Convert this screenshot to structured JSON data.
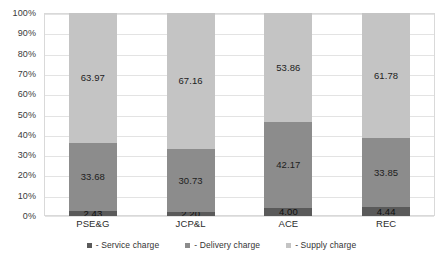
{
  "chart_data": {
    "type": "bar",
    "title": "",
    "subtitle": "",
    "xlabel": "",
    "ylabel": "",
    "stacked": true,
    "stack_mode": "percent",
    "grid": true,
    "legend_position": "bottom",
    "ylim": [
      0,
      100
    ],
    "ytick_labels": [
      "100%",
      "90%",
      "80%",
      "70%",
      "60%",
      "50%",
      "40%",
      "30%",
      "20%",
      "10%",
      "0%"
    ],
    "ytick_values": [
      100,
      90,
      80,
      70,
      60,
      50,
      40,
      30,
      20,
      10,
      0
    ],
    "categories": [
      "PSE&G",
      "JCP&L",
      "ACE",
      "REC"
    ],
    "series": [
      {
        "name": "- Service charge",
        "color": "#5a5a5a",
        "values": [
          2.43,
          2.2,
          4.0,
          4.44
        ],
        "labels": [
          "2.43",
          "2.20",
          "4.00",
          "4.44"
        ]
      },
      {
        "name": "- Delivery charge",
        "color": "#8c8c8c",
        "values": [
          33.68,
          30.73,
          42.17,
          33.85
        ],
        "labels": [
          "33.68",
          "30.73",
          "42.17",
          "33.85"
        ]
      },
      {
        "name": "- Supply charge",
        "color": "#c4c4c4",
        "values": [
          63.97,
          67.16,
          53.86,
          61.78
        ],
        "labels": [
          "63.97",
          "67.16",
          "53.86",
          "61.78"
        ]
      }
    ]
  },
  "colors": {
    "service": "#5a5a5a",
    "delivery": "#8c8c8c",
    "supply": "#c4c4c4",
    "grid": "#e3e3e3",
    "frame": "#d9d9d9",
    "text": "#333333",
    "background": "#ffffff"
  }
}
